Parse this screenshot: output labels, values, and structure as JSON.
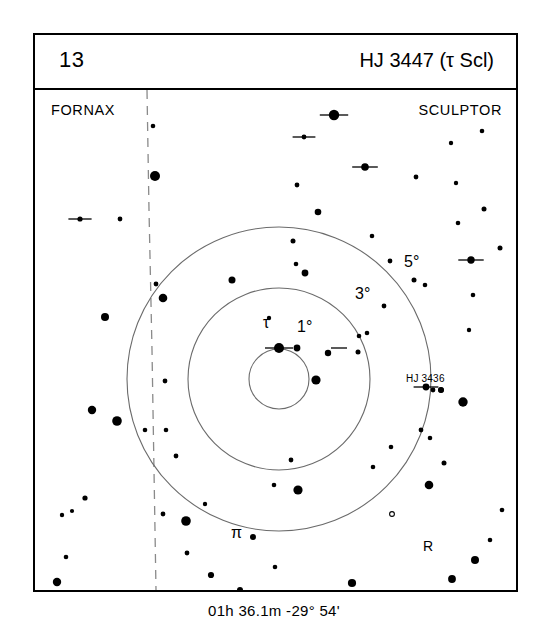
{
  "header": {
    "chart_number": "13",
    "title": "HJ 3447 (τ Scl)"
  },
  "footer": {
    "coordinates": "01h 36.1m  -29° 54'"
  },
  "constellations": {
    "left": "FORNAX",
    "right": "SCULPTOR"
  },
  "rings": {
    "r1_label": "1°",
    "r3_label": "3°",
    "r5_label": "5°"
  },
  "star_labels": {
    "tau": "τ",
    "pi": "π",
    "variable_r": "R",
    "hj3436": "HJ 3436"
  },
  "colors": {
    "ink": "#000000",
    "paper": "#ffffff",
    "ring_stroke": "#6b6b6b",
    "boundary_stroke": "#8a8a8a"
  },
  "chart_data": {
    "type": "scatter",
    "title": "HJ 3447 (τ Scl)",
    "subtitle": "Double star finder chart",
    "center_coordinates": {
      "ra": "01h 36.1m",
      "dec": "-29° 54'"
    },
    "center_pixel": {
      "x": 244,
      "y": 289
    },
    "rings": [
      {
        "label": "1°",
        "degrees": 1,
        "radius_px": 30
      },
      {
        "label": "3°",
        "degrees": 3,
        "radius_px": 91
      },
      {
        "label": "5°",
        "degrees": 5,
        "radius_px": 152
      }
    ],
    "constellation_boundary": {
      "style": "dashed",
      "points": [
        [
          112,
          0
        ],
        [
          114,
          120
        ],
        [
          117,
          260
        ],
        [
          119,
          380
        ],
        [
          121,
          500
        ]
      ]
    },
    "legend": {
      "filled_circle": "star (size = magnitude)",
      "open_circle": "variable star",
      "tick_mark": "double star"
    },
    "stars": [
      {
        "x": 118,
        "y": 36,
        "r": 2.3,
        "type": "star"
      },
      {
        "x": 120,
        "y": 86,
        "r": 5.0,
        "type": "star"
      },
      {
        "x": 45,
        "y": 129,
        "r": 2.6,
        "type": "double"
      },
      {
        "x": 85,
        "y": 129,
        "r": 2.4,
        "type": "star"
      },
      {
        "x": 121,
        "y": 194,
        "r": 2.4,
        "type": "star"
      },
      {
        "x": 128,
        "y": 208,
        "r": 4.3,
        "type": "star"
      },
      {
        "x": 70,
        "y": 227,
        "r": 4.0,
        "type": "star"
      },
      {
        "x": 57,
        "y": 320,
        "r": 4.2,
        "type": "star"
      },
      {
        "x": 82,
        "y": 331,
        "r": 4.8,
        "type": "star"
      },
      {
        "x": 131,
        "y": 340,
        "r": 2.3,
        "type": "star"
      },
      {
        "x": 50,
        "y": 408,
        "r": 2.6,
        "type": "star"
      },
      {
        "x": 27,
        "y": 425,
        "r": 2.2,
        "type": "star"
      },
      {
        "x": 37,
        "y": 421,
        "r": 2.1,
        "type": "star"
      },
      {
        "x": 31,
        "y": 467,
        "r": 2.3,
        "type": "star"
      },
      {
        "x": 22,
        "y": 492,
        "r": 4.2,
        "type": "star"
      },
      {
        "x": 110,
        "y": 340,
        "r": 2.3,
        "type": "star"
      },
      {
        "x": 128,
        "y": 424,
        "r": 2.4,
        "type": "star"
      },
      {
        "x": 152,
        "y": 463,
        "r": 2.4,
        "type": "star"
      },
      {
        "x": 176,
        "y": 485,
        "r": 3.1,
        "type": "star"
      },
      {
        "x": 205,
        "y": 500,
        "r": 3.0,
        "type": "star"
      },
      {
        "x": 240,
        "y": 477,
        "r": 2.3,
        "type": "star"
      },
      {
        "x": 317,
        "y": 493,
        "r": 4.1,
        "type": "star"
      },
      {
        "x": 332,
        "y": 512,
        "r": 3.0,
        "type": "star"
      },
      {
        "x": 299,
        "y": 25,
        "r": 5.2,
        "type": "double"
      },
      {
        "x": 269,
        "y": 47,
        "r": 2.4,
        "type": "double"
      },
      {
        "x": 330,
        "y": 77,
        "r": 3.8,
        "type": "double"
      },
      {
        "x": 447,
        "y": 41,
        "r": 2.3,
        "type": "star"
      },
      {
        "x": 416,
        "y": 53,
        "r": 2.2,
        "type": "star"
      },
      {
        "x": 381,
        "y": 87,
        "r": 2.4,
        "type": "star"
      },
      {
        "x": 421,
        "y": 93,
        "r": 2.2,
        "type": "star"
      },
      {
        "x": 423,
        "y": 133,
        "r": 2.3,
        "type": "star"
      },
      {
        "x": 449,
        "y": 119,
        "r": 2.5,
        "type": "star"
      },
      {
        "x": 436,
        "y": 170,
        "r": 3.7,
        "type": "double"
      },
      {
        "x": 465,
        "y": 158,
        "r": 2.5,
        "type": "star"
      },
      {
        "x": 438,
        "y": 205,
        "r": 2.3,
        "type": "star"
      },
      {
        "x": 434,
        "y": 240,
        "r": 2.2,
        "type": "star"
      },
      {
        "x": 262,
        "y": 95,
        "r": 2.4,
        "type": "star"
      },
      {
        "x": 283,
        "y": 122,
        "r": 3.3,
        "type": "star"
      },
      {
        "x": 258,
        "y": 151,
        "r": 2.5,
        "type": "star"
      },
      {
        "x": 261,
        "y": 174,
        "r": 2.3,
        "type": "star"
      },
      {
        "x": 270,
        "y": 183,
        "r": 3.4,
        "type": "star"
      },
      {
        "x": 337,
        "y": 146,
        "r": 2.3,
        "type": "star"
      },
      {
        "x": 355,
        "y": 171,
        "r": 2.4,
        "type": "star"
      },
      {
        "x": 379,
        "y": 190,
        "r": 2.5,
        "type": "star"
      },
      {
        "x": 390,
        "y": 195,
        "r": 2.3,
        "type": "star"
      },
      {
        "x": 349,
        "y": 216,
        "r": 2.4,
        "type": "star"
      },
      {
        "x": 324,
        "y": 246,
        "r": 2.3,
        "type": "star"
      },
      {
        "x": 197,
        "y": 190,
        "r": 3.5,
        "type": "star"
      },
      {
        "x": 234,
        "y": 228,
        "r": 2.2,
        "type": "star"
      },
      {
        "x": 244,
        "y": 258,
        "r": 5.0,
        "type": "primary_double"
      },
      {
        "x": 293,
        "y": 263,
        "r": 3.2,
        "type": "star"
      },
      {
        "x": 281,
        "y": 290,
        "r": 4.6,
        "type": "star"
      },
      {
        "x": 323,
        "y": 262,
        "r": 2.5,
        "type": "star"
      },
      {
        "x": 391,
        "y": 297,
        "r": 3.4,
        "type": "double"
      },
      {
        "x": 406,
        "y": 300,
        "r": 2.8,
        "type": "star"
      },
      {
        "x": 130,
        "y": 291,
        "r": 2.4,
        "type": "star"
      },
      {
        "x": 141,
        "y": 366,
        "r": 2.4,
        "type": "star"
      },
      {
        "x": 256,
        "y": 370,
        "r": 2.4,
        "type": "star"
      },
      {
        "x": 239,
        "y": 395,
        "r": 2.3,
        "type": "star"
      },
      {
        "x": 263,
        "y": 400,
        "r": 4.6,
        "type": "star"
      },
      {
        "x": 170,
        "y": 414,
        "r": 2.2,
        "type": "star"
      },
      {
        "x": 338,
        "y": 377,
        "r": 2.3,
        "type": "star"
      },
      {
        "x": 386,
        "y": 340,
        "r": 2.4,
        "type": "star"
      },
      {
        "x": 356,
        "y": 357,
        "r": 2.3,
        "type": "star"
      },
      {
        "x": 409,
        "y": 373,
        "r": 2.5,
        "type": "star"
      },
      {
        "x": 398,
        "y": 300,
        "r": 2.4,
        "type": "star"
      },
      {
        "x": 395,
        "y": 348,
        "r": 2.3,
        "type": "star"
      },
      {
        "x": 428,
        "y": 312,
        "r": 4.7,
        "type": "star"
      },
      {
        "x": 394,
        "y": 395,
        "r": 4.3,
        "type": "star"
      },
      {
        "x": 440,
        "y": 470,
        "r": 4.0,
        "type": "star"
      },
      {
        "x": 417,
        "y": 489,
        "r": 3.9,
        "type": "star"
      },
      {
        "x": 455,
        "y": 450,
        "r": 2.3,
        "type": "star"
      },
      {
        "x": 467,
        "y": 420,
        "r": 2.3,
        "type": "star"
      },
      {
        "x": 151,
        "y": 431,
        "r": 4.8,
        "type": "star"
      },
      {
        "x": 218,
        "y": 447,
        "r": 3.0,
        "type": "star"
      },
      {
        "x": 332,
        "y": 243,
        "r": 2.3,
        "type": "star"
      },
      {
        "x": 357,
        "y": 424,
        "r": 2.4,
        "type": "variable"
      }
    ]
  }
}
